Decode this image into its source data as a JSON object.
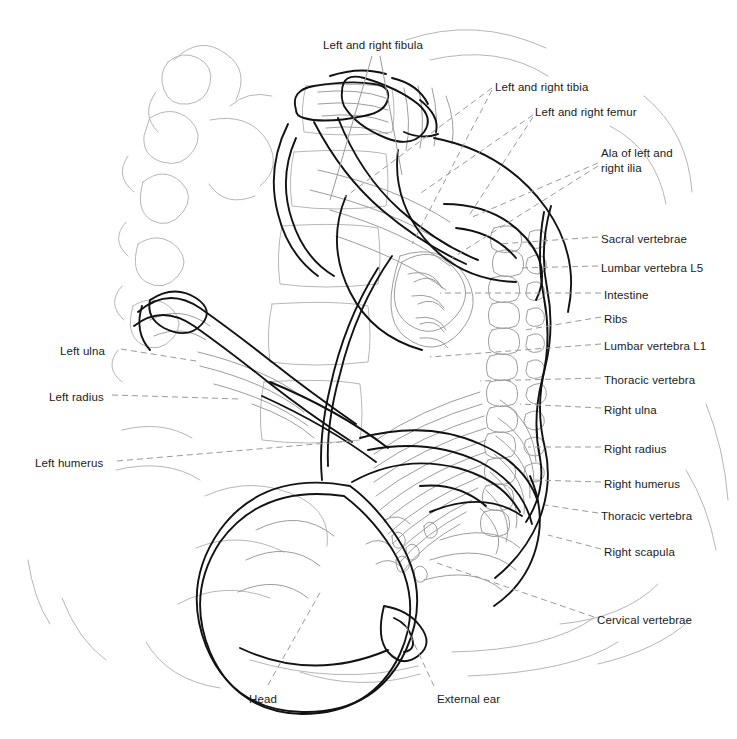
{
  "figure": {
    "kind": "anatomical-line-drawing",
    "background_color": "#ffffff",
    "trace_color": "#111111",
    "underlay_color": "#b3b3b3",
    "leader_color": "#9a9a9a"
  },
  "labels": [
    {
      "id": "fibula",
      "text": "Left and right fibula",
      "x": 323,
      "y": 38,
      "anchor": "left",
      "lines": 1
    },
    {
      "id": "tibia",
      "text": "Left and right tibia",
      "x": 495,
      "y": 80,
      "anchor": "left",
      "lines": 1
    },
    {
      "id": "femur",
      "text": "Left and right femur",
      "x": 535,
      "y": 105,
      "anchor": "left",
      "lines": 1
    },
    {
      "id": "ilia",
      "text": "Ala of left and\nright ilia",
      "x": 601,
      "y": 146,
      "anchor": "left",
      "lines": 2
    },
    {
      "id": "sacral",
      "text": "Sacral vertebrae",
      "x": 601,
      "y": 232,
      "anchor": "left",
      "lines": 1
    },
    {
      "id": "lumbar-l5",
      "text": "Lumbar vertebra L5",
      "x": 601,
      "y": 261,
      "anchor": "left",
      "lines": 1
    },
    {
      "id": "intestine",
      "text": "Intestine",
      "x": 604,
      "y": 288,
      "anchor": "left",
      "lines": 1
    },
    {
      "id": "ribs",
      "text": "Ribs",
      "x": 604,
      "y": 312,
      "anchor": "left",
      "lines": 1
    },
    {
      "id": "lumbar-l1",
      "text": "Lumbar vertebra L1",
      "x": 604,
      "y": 339,
      "anchor": "left",
      "lines": 1
    },
    {
      "id": "thoracic-upper",
      "text": "Thoracic vertebra",
      "x": 604,
      "y": 373,
      "anchor": "left",
      "lines": 1
    },
    {
      "id": "right-ulna",
      "text": "Right ulna",
      "x": 604,
      "y": 403,
      "anchor": "left",
      "lines": 1
    },
    {
      "id": "right-radius",
      "text": "Right radius",
      "x": 604,
      "y": 442,
      "anchor": "left",
      "lines": 1
    },
    {
      "id": "right-humerus",
      "text": "Right humerus",
      "x": 604,
      "y": 477,
      "anchor": "left",
      "lines": 1
    },
    {
      "id": "thoracic-lower",
      "text": "Thoracic vertebra",
      "x": 601,
      "y": 509,
      "anchor": "left",
      "lines": 1
    },
    {
      "id": "right-scapula",
      "text": "Right scapula",
      "x": 604,
      "y": 545,
      "anchor": "left",
      "lines": 1
    },
    {
      "id": "cervical",
      "text": "Cervical vertebrae",
      "x": 597,
      "y": 613,
      "anchor": "left",
      "lines": 1
    },
    {
      "id": "left-ulna",
      "text": "Left ulna",
      "x": 60,
      "y": 344,
      "anchor": "left",
      "lines": 1
    },
    {
      "id": "left-radius",
      "text": "Left radius",
      "x": 49,
      "y": 390,
      "anchor": "left",
      "lines": 1
    },
    {
      "id": "left-humerus",
      "text": "Left humerus",
      "x": 35,
      "y": 456,
      "anchor": "left",
      "lines": 1
    },
    {
      "id": "head",
      "text": "Head",
      "x": 249,
      "y": 692,
      "anchor": "left",
      "lines": 1
    },
    {
      "id": "external-ear",
      "text": "External ear",
      "x": 437,
      "y": 692,
      "anchor": "left",
      "lines": 1
    }
  ],
  "leaders": [
    {
      "id": "fibula-a",
      "from": [
        372,
        56
      ],
      "to": [
        330,
        200
      ],
      "style": "solid"
    },
    {
      "id": "fibula-b",
      "from": [
        380,
        56
      ],
      "to": [
        402,
        175
      ],
      "style": "solid"
    },
    {
      "id": "tibia-a",
      "from": [
        492,
        88
      ],
      "to": [
        345,
        197
      ],
      "style": "dashed"
    },
    {
      "id": "tibia-b",
      "from": [
        492,
        90
      ],
      "to": [
        412,
        244
      ],
      "style": "dashed"
    },
    {
      "id": "femur-a",
      "from": [
        533,
        115
      ],
      "to": [
        418,
        195
      ],
      "style": "dashed"
    },
    {
      "id": "femur-b",
      "from": [
        533,
        117
      ],
      "to": [
        470,
        214
      ],
      "style": "dashed"
    },
    {
      "id": "ilia-a",
      "from": [
        598,
        163
      ],
      "to": [
        470,
        218
      ],
      "style": "dashed"
    },
    {
      "id": "ilia-b",
      "from": [
        598,
        166
      ],
      "to": [
        452,
        258
      ],
      "style": "dashed"
    },
    {
      "id": "sacral",
      "from": [
        598,
        237
      ],
      "to": [
        498,
        244
      ],
      "style": "dashed"
    },
    {
      "id": "lumbar-l5",
      "from": [
        598,
        266
      ],
      "to": [
        518,
        268
      ],
      "style": "dashed"
    },
    {
      "id": "intestine",
      "from": [
        601,
        293
      ],
      "to": [
        440,
        293
      ],
      "style": "dashed"
    },
    {
      "id": "ribs",
      "from": [
        601,
        317
      ],
      "to": [
        525,
        330
      ],
      "style": "dashed"
    },
    {
      "id": "lumbar-l1",
      "from": [
        601,
        344
      ],
      "to": [
        430,
        357
      ],
      "style": "dashed"
    },
    {
      "id": "thoracic-upper",
      "from": [
        601,
        378
      ],
      "to": [
        480,
        381
      ],
      "style": "dashed"
    },
    {
      "id": "right-ulna",
      "from": [
        601,
        408
      ],
      "to": [
        520,
        404
      ],
      "style": "dashed"
    },
    {
      "id": "right-radius",
      "from": [
        601,
        447
      ],
      "to": [
        528,
        447
      ],
      "style": "dashed"
    },
    {
      "id": "right-humerus",
      "from": [
        601,
        482
      ],
      "to": [
        532,
        480
      ],
      "style": "dashed"
    },
    {
      "id": "thoracic-lower",
      "from": [
        598,
        513
      ],
      "to": [
        545,
        505
      ],
      "style": "dashed"
    },
    {
      "id": "right-scapula",
      "from": [
        601,
        549
      ],
      "to": [
        548,
        535
      ],
      "style": "dashed"
    },
    {
      "id": "cervical",
      "from": [
        594,
        617
      ],
      "to": [
        437,
        563
      ],
      "style": "dashed"
    },
    {
      "id": "left-ulna",
      "from": [
        121,
        349
      ],
      "to": [
        196,
        361
      ],
      "style": "dashed"
    },
    {
      "id": "left-radius",
      "from": [
        112,
        395
      ],
      "to": [
        240,
        399
      ],
      "style": "dashed"
    },
    {
      "id": "left-humerus",
      "from": [
        117,
        461
      ],
      "to": [
        352,
        441
      ],
      "style": "dashed"
    },
    {
      "id": "head",
      "from": [
        268,
        685
      ],
      "to": [
        322,
        589
      ],
      "style": "dashed"
    },
    {
      "id": "external-ear",
      "from": [
        434,
        686
      ],
      "to": [
        404,
        622
      ],
      "style": "dashed"
    }
  ]
}
